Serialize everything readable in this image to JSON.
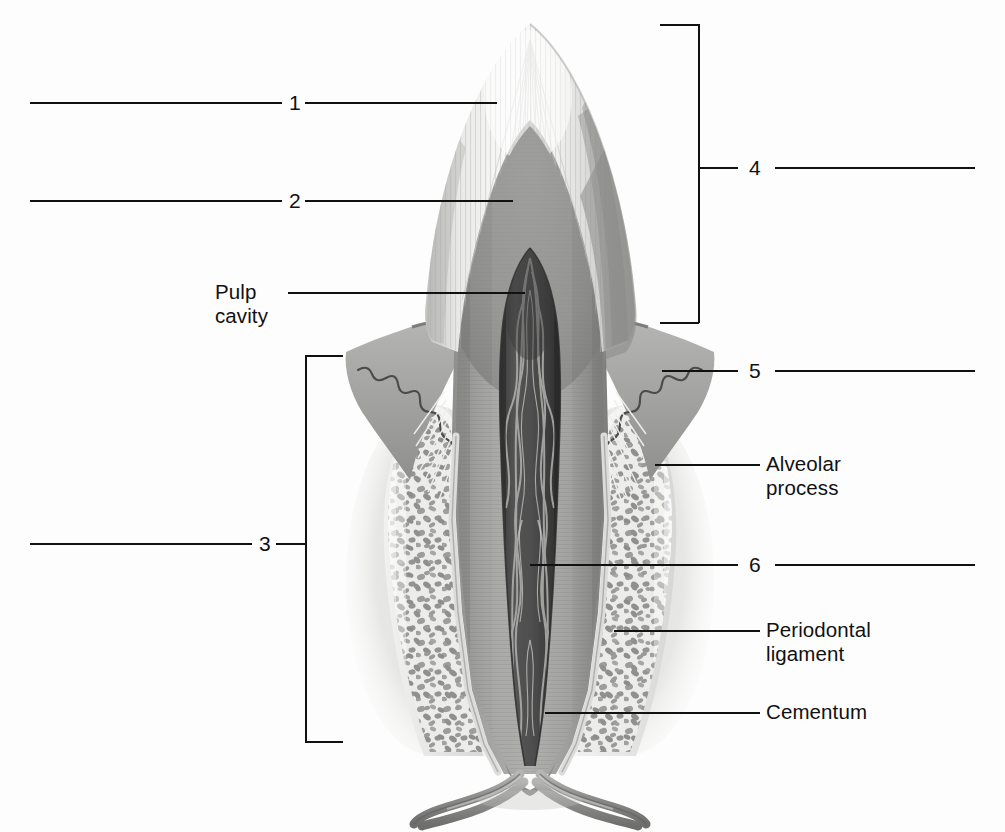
{
  "figure": {
    "type": "anatomical-illustration",
    "style": "grayscale-labeled-diagram"
  },
  "labels": {
    "n1": "1",
    "n2": "2",
    "n3": "3",
    "n4": "4",
    "n5": "5",
    "n6": "6",
    "pulp_cavity": "Pulp\ncavity",
    "alveolar_process": "Alveolar\nprocess",
    "periodontal_ligament": "Periodontal\nligament",
    "cementum": "Cementum"
  },
  "callouts": [
    {
      "id": "1",
      "text": "1",
      "side": "left",
      "kind": "number",
      "target": "enamel"
    },
    {
      "id": "2",
      "text": "2",
      "side": "left",
      "kind": "number",
      "target": "dentin"
    },
    {
      "id": "3",
      "text": "3",
      "side": "left",
      "kind": "bracket-number",
      "target": "root-region"
    },
    {
      "id": "4",
      "text": "4",
      "side": "right",
      "kind": "bracket-number",
      "target": "crown-region"
    },
    {
      "id": "5",
      "text": "5",
      "side": "right",
      "kind": "number",
      "target": "gingiva"
    },
    {
      "id": "6",
      "text": "6",
      "side": "right",
      "kind": "number",
      "target": "root-canal"
    },
    {
      "id": "pulp-cavity",
      "text": "Pulp cavity",
      "side": "left",
      "kind": "text",
      "target": "pulp-chamber"
    },
    {
      "id": "alveolar-process",
      "text": "Alveolar process",
      "side": "right",
      "kind": "text",
      "target": "trabecular-bone"
    },
    {
      "id": "periodontal-ligament",
      "text": "Periodontal ligament",
      "side": "right",
      "kind": "text",
      "target": "pdl-space"
    },
    {
      "id": "cementum",
      "text": "Cementum",
      "side": "right",
      "kind": "text",
      "target": "root-surface"
    }
  ],
  "colors": {
    "ink": "#111111",
    "background": "#fdfdfd",
    "enamel_light": "#f4f4f2",
    "enamel_shadow": "#c9c9c7",
    "dentin": "#9b9b99",
    "dentin_dark": "#7e7e7c",
    "pulp_dark": "#4a4a4a",
    "pulp_darkest": "#2e2e2e",
    "gingiva": "#a7a7a5",
    "gingiva_dark": "#8c8c8a",
    "bone_light": "#e8e8e6",
    "bone_trabecula": "#9a9a98",
    "cementum_line": "#d8d8d6",
    "vessel": "#8e8e8c"
  }
}
